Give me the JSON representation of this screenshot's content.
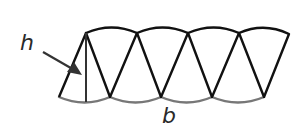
{
  "diagram": {
    "labels": {
      "height": "h",
      "base": "b"
    },
    "sector_count": 8,
    "colors": {
      "outline": "#111111",
      "bottom_arcs": "#777777",
      "height_line": "#333333",
      "arrow": "#333333",
      "background": "#ffffff"
    }
  }
}
